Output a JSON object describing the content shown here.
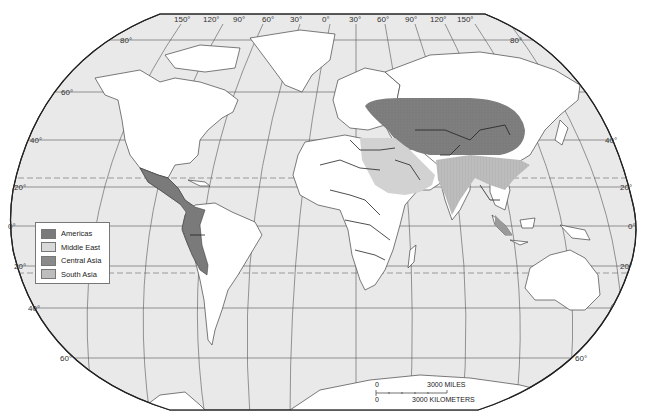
{
  "map": {
    "projection": "Robinson-style world map",
    "colors": {
      "ocean": "#e9e9e9",
      "land": "#ffffff",
      "border": "#222222",
      "graticule": "#444444",
      "americas": "#7a7a7a",
      "middle_east": "#cfcfcf",
      "central_asia": "#7c7c7c",
      "south_asia": "#b9b9b9"
    },
    "longitude_labels": [
      "150°",
      "120°",
      "90°",
      "60°",
      "30°",
      "0°",
      "30°",
      "60°",
      "90°",
      "120°",
      "150°"
    ],
    "latitude_labels_left": [
      "80°",
      "60°",
      "40°",
      "20°",
      "0°",
      "20°",
      "40°",
      "60°"
    ],
    "latitude_labels_right": [
      "80°",
      "60°",
      "40°",
      "20°",
      "0°",
      "20°",
      "40°",
      "60°"
    ]
  },
  "legend": {
    "items": [
      {
        "label": "Americas",
        "color": "#7a7a7a"
      },
      {
        "label": "Middle East",
        "color": "#d9d9d9"
      },
      {
        "label": "Central Asia",
        "color": "#8a8a8a"
      },
      {
        "label": "South Asia",
        "color": "#bdbdbd"
      }
    ]
  },
  "scale_bar": {
    "zero_top": "0",
    "miles_label": "3000  MILES",
    "zero_bottom": "0",
    "km_label": "3000  KILOMETERS"
  }
}
